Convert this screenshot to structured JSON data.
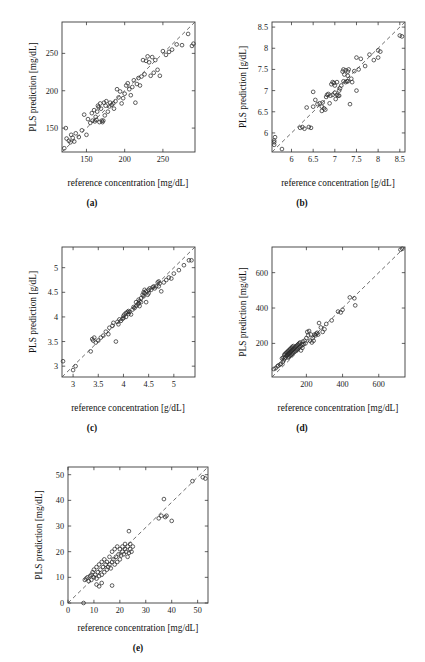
{
  "figure": {
    "type": "multi-panel-scatter-figure",
    "panel_count": 5,
    "background_color": "#ffffff",
    "marker_color": "#2b2b2b",
    "line_color": "#555555",
    "axis_color": "#3a3a3a"
  },
  "panels": [
    {
      "id": "a",
      "caption": "(a)",
      "xlabel": "reference concentration [mg/dL]",
      "ylabel": "PLS prediction [mg/dL]"
    },
    {
      "id": "b",
      "caption": "(b)",
      "xlabel": "reference concentration [g/dL]",
      "ylabel": "PLS prediction [g/dL]"
    },
    {
      "id": "c",
      "caption": "(c)",
      "xlabel": "reference concentration [g/dL]",
      "ylabel": "PLS prediction [g/dL]"
    },
    {
      "id": "d",
      "caption": "(d)",
      "xlabel": "reference concentration [mg/dL]",
      "ylabel": "PLS prediction [mg/dL]"
    },
    {
      "id": "e",
      "caption": "(e)",
      "xlabel": "reference concentration [mg/dL]",
      "ylabel": "PLS prediction [mg/dL]"
    }
  ],
  "chart_data": [
    {
      "type": "scatter",
      "panel": "a",
      "title": "(a)",
      "xlabel": "reference concentration [mg/dL]",
      "ylabel": "PLS prediction [mg/dL]",
      "xlim": [
        118,
        292
      ],
      "ylim": [
        118,
        292
      ],
      "xticks": [
        150,
        200,
        250
      ],
      "yticks": [
        150,
        200,
        250
      ],
      "xticklabels": [
        "150",
        "200",
        "250"
      ],
      "yticklabels": [
        "150",
        "200",
        "250"
      ],
      "grid": false,
      "legend": null,
      "reference_line": {
        "type": "identity",
        "style": "dashed",
        "from": [
          118,
          118
        ],
        "to": [
          292,
          292
        ]
      },
      "x": [
        121,
        123,
        124,
        127,
        129,
        130,
        132,
        134,
        136,
        140,
        144,
        147,
        150,
        152,
        155,
        157,
        158,
        160,
        161,
        162,
        163,
        164,
        165,
        166,
        167,
        168,
        169,
        170,
        171,
        172,
        173,
        174,
        175,
        176,
        178,
        180,
        181,
        183,
        185,
        186,
        188,
        190,
        192,
        194,
        196,
        198,
        200,
        202,
        204,
        206,
        208,
        210,
        212,
        214,
        216,
        218,
        220,
        222,
        224,
        226,
        228,
        230,
        232,
        234,
        236,
        238,
        240,
        243,
        246,
        250,
        254,
        258,
        262,
        268,
        275,
        283,
        288,
        290
      ],
      "y": [
        123,
        150,
        136,
        133,
        131,
        141,
        137,
        132,
        143,
        138,
        147,
        168,
        141,
        162,
        157,
        170,
        160,
        174,
        159,
        165,
        161,
        172,
        180,
        178,
        158,
        183,
        176,
        160,
        158,
        160,
        184,
        167,
        180,
        186,
        172,
        179,
        184,
        181,
        183,
        176,
        186,
        202,
        191,
        199,
        183,
        190,
        196,
        207,
        210,
        202,
        194,
        205,
        214,
        184,
        209,
        217,
        207,
        219,
        241,
        222,
        240,
        246,
        238,
        220,
        245,
        224,
        241,
        228,
        220,
        253,
        248,
        252,
        255,
        262,
        261,
        276,
        260,
        263
      ],
      "n_points": 78
    },
    {
      "type": "scatter",
      "panel": "b",
      "title": "(b)",
      "xlabel": "reference concentration [g/dL]",
      "ylabel": "PLS prediction [g/dL]",
      "xlim": [
        5.55,
        8.62
      ],
      "ylim": [
        5.55,
        8.62
      ],
      "xticks": [
        6,
        6.5,
        7,
        7.5,
        8,
        8.5
      ],
      "yticks": [
        6,
        6.5,
        7,
        7.5,
        8,
        8.5
      ],
      "xticklabels": [
        "6",
        "6.5",
        "7",
        "7.5",
        "8",
        "8.5"
      ],
      "yticklabels": [
        "6",
        "6.5",
        "7",
        "7.5",
        "8",
        "8.5"
      ],
      "grid": false,
      "legend": null,
      "reference_line": {
        "type": "identity",
        "style": "dashed",
        "from": [
          5.55,
          5.55
        ],
        "to": [
          8.62,
          8.62
        ]
      },
      "x": [
        5.6,
        5.6,
        5.6,
        5.62,
        5.78,
        6.2,
        6.25,
        6.3,
        6.35,
        6.4,
        6.45,
        6.5,
        6.5,
        6.55,
        6.6,
        6.65,
        6.7,
        6.7,
        6.72,
        6.75,
        6.78,
        6.8,
        6.82,
        6.85,
        6.88,
        6.9,
        6.92,
        6.95,
        6.95,
        6.98,
        7.0,
        7.0,
        7.02,
        7.05,
        7.05,
        7.08,
        7.1,
        7.1,
        7.12,
        7.15,
        7.18,
        7.2,
        7.2,
        7.22,
        7.25,
        7.25,
        7.28,
        7.3,
        7.3,
        7.3,
        7.32,
        7.35,
        7.38,
        7.4,
        7.45,
        7.5,
        7.5,
        7.55,
        7.6,
        7.7,
        7.8,
        7.9,
        8.0,
        8.0,
        8.05,
        8.5,
        8.55
      ],
      "y": [
        5.82,
        5.78,
        5.72,
        5.9,
        5.62,
        6.12,
        6.14,
        6.1,
        6.6,
        6.14,
        6.12,
        6.97,
        6.62,
        6.78,
        6.68,
        6.7,
        6.52,
        6.62,
        6.72,
        6.58,
        6.55,
        6.85,
        6.9,
        6.92,
        6.7,
        6.88,
        7.15,
        6.9,
        7.2,
        7.18,
        7.12,
        6.95,
        6.8,
        6.9,
        7.2,
        6.88,
        7.0,
        6.88,
        7.05,
        7.12,
        7.45,
        7.5,
        7.22,
        7.38,
        7.48,
        7.2,
        7.22,
        7.22,
        7.35,
        7.45,
        7.5,
        6.68,
        7.28,
        7.2,
        7.46,
        7.0,
        7.78,
        7.5,
        7.75,
        7.58,
        7.85,
        7.72,
        7.95,
        7.78,
        7.92,
        8.3,
        8.28
      ],
      "n_points": 67
    },
    {
      "type": "scatter",
      "panel": "c",
      "title": "(c)",
      "xlabel": "reference concentration [g/dL]",
      "ylabel": "PLS prediction [g/dL]",
      "xlim": [
        2.78,
        5.42
      ],
      "ylim": [
        2.78,
        5.42
      ],
      "xticks": [
        3,
        3.5,
        4,
        4.5,
        5
      ],
      "yticks": [
        3,
        3.5,
        4,
        4.5,
        5
      ],
      "xticklabels": [
        "3",
        "3.5",
        "4",
        "4.5",
        "5"
      ],
      "yticklabels": [
        "3",
        "3.5",
        "4",
        "4.5",
        "5"
      ],
      "grid": false,
      "legend": null,
      "reference_line": {
        "type": "identity",
        "style": "dashed",
        "from": [
          2.78,
          2.78
        ],
        "to": [
          5.42,
          5.42
        ]
      },
      "x": [
        2.8,
        3.0,
        3.05,
        3.35,
        3.38,
        3.4,
        3.42,
        3.45,
        3.5,
        3.55,
        3.6,
        3.65,
        3.7,
        3.72,
        3.78,
        3.8,
        3.85,
        3.88,
        3.9,
        3.92,
        3.95,
        3.98,
        4.0,
        4.0,
        4.02,
        4.05,
        4.05,
        4.08,
        4.1,
        4.1,
        4.12,
        4.15,
        4.18,
        4.2,
        4.22,
        4.25,
        4.25,
        4.28,
        4.3,
        4.3,
        4.32,
        4.32,
        4.35,
        4.35,
        4.38,
        4.4,
        4.4,
        4.42,
        4.42,
        4.45,
        4.45,
        4.48,
        4.5,
        4.5,
        4.52,
        4.55,
        4.58,
        4.6,
        4.62,
        4.65,
        4.68,
        4.7,
        4.7,
        4.72,
        4.75,
        4.8,
        4.85,
        4.9,
        4.95,
        5.0,
        5.1,
        5.2,
        5.3,
        5.35
      ],
      "y": [
        3.1,
        2.92,
        3.0,
        3.3,
        3.55,
        3.52,
        3.58,
        3.48,
        3.52,
        3.58,
        3.62,
        3.7,
        3.65,
        3.78,
        3.82,
        3.88,
        3.5,
        3.9,
        3.85,
        3.95,
        3.92,
        3.96,
        4.02,
        3.98,
        4.05,
        4.08,
        4.0,
        4.1,
        4.06,
        4.12,
        4.1,
        4.05,
        4.15,
        4.2,
        4.18,
        4.22,
        4.3,
        4.25,
        4.28,
        4.35,
        4.32,
        4.22,
        4.38,
        4.3,
        4.45,
        4.5,
        4.42,
        4.48,
        4.55,
        4.52,
        4.3,
        4.45,
        4.55,
        4.48,
        4.58,
        4.55,
        4.6,
        4.62,
        4.58,
        4.62,
        4.7,
        4.72,
        4.62,
        4.68,
        4.52,
        4.7,
        4.75,
        4.8,
        4.78,
        4.88,
        4.95,
        5.05,
        5.15,
        5.15
      ],
      "n_points": 74
    },
    {
      "type": "scatter",
      "panel": "d",
      "title": "(d)",
      "xlabel": "reference concentration [mg/dL]",
      "ylabel": "PLS prediction [mg/dL]",
      "xlim": [
        10,
        745
      ],
      "ylim": [
        10,
        745
      ],
      "xticks": [
        200,
        400,
        600
      ],
      "yticks": [
        200,
        400,
        600
      ],
      "xticklabels": [
        "200",
        "400",
        "600"
      ],
      "yticklabels": [
        "200",
        "400",
        "600"
      ],
      "grid": false,
      "legend": null,
      "reference_line": {
        "type": "identity",
        "style": "dashed",
        "from": [
          10,
          10
        ],
        "to": [
          745,
          745
        ]
      },
      "x": [
        20,
        30,
        40,
        45,
        55,
        60,
        65,
        70,
        72,
        75,
        78,
        80,
        82,
        85,
        88,
        90,
        92,
        95,
        98,
        100,
        100,
        102,
        105,
        105,
        108,
        110,
        110,
        112,
        115,
        115,
        118,
        120,
        120,
        122,
        125,
        125,
        128,
        130,
        132,
        135,
        138,
        140,
        142,
        145,
        148,
        150,
        152,
        155,
        158,
        160,
        162,
        165,
        168,
        170,
        175,
        178,
        180,
        185,
        190,
        195,
        200,
        205,
        210,
        215,
        220,
        225,
        230,
        235,
        240,
        245,
        250,
        255,
        260,
        265,
        270,
        280,
        290,
        300,
        310,
        340,
        375,
        390,
        400,
        440,
        465,
        470,
        720,
        730
      ],
      "y": [
        55,
        60,
        70,
        75,
        80,
        85,
        115,
        95,
        120,
        105,
        135,
        115,
        140,
        120,
        145,
        130,
        150,
        135,
        155,
        140,
        120,
        160,
        145,
        125,
        165,
        150,
        130,
        170,
        155,
        135,
        175,
        160,
        140,
        180,
        165,
        145,
        185,
        170,
        150,
        175,
        155,
        180,
        160,
        185,
        165,
        190,
        170,
        195,
        175,
        200,
        180,
        205,
        185,
        160,
        195,
        175,
        210,
        195,
        215,
        200,
        230,
        265,
        245,
        270,
        215,
        250,
        205,
        230,
        215,
        250,
        245,
        255,
        260,
        250,
        315,
        290,
        265,
        280,
        310,
        330,
        380,
        375,
        390,
        460,
        455,
        415,
        730,
        735
      ],
      "n_points": 88
    },
    {
      "type": "scatter",
      "panel": "e",
      "title": "(e)",
      "xlabel": "reference concentration [mg/dL]",
      "ylabel": "PLS prediction [mg/dL]",
      "xlim": [
        0,
        54
      ],
      "ylim": [
        0,
        53
      ],
      "xticks": [
        0,
        10,
        20,
        30,
        40,
        50
      ],
      "yticks": [
        0,
        10,
        20,
        30,
        40,
        50
      ],
      "xticklabels": [
        "0",
        "10",
        "20",
        "30",
        "40",
        "50"
      ],
      "yticklabels": [
        "0",
        "10",
        "20",
        "30",
        "40",
        "50"
      ],
      "grid": false,
      "legend": null,
      "reference_line": {
        "type": "identity",
        "style": "dashed",
        "from": [
          0,
          0
        ],
        "to": [
          54,
          53
        ]
      },
      "x": [
        6,
        6.5,
        7,
        7.5,
        8,
        8.5,
        9,
        9,
        9.5,
        10,
        10,
        10.5,
        11,
        11,
        11.5,
        12,
        12,
        12.5,
        13,
        13,
        13.5,
        14,
        14,
        14.5,
        15,
        15,
        15.5,
        16,
        16,
        16.5,
        17,
        17,
        17.5,
        18,
        18,
        18.5,
        19,
        19,
        19.5,
        20,
        20,
        20.5,
        21,
        21,
        21.5,
        22,
        22,
        22.5,
        23,
        23,
        23.5,
        24,
        24,
        24.5,
        25,
        17,
        12,
        13,
        11,
        23.5,
        35,
        36,
        37,
        37.5,
        38,
        40,
        48,
        52,
        53
      ],
      "y": [
        0,
        9,
        9.5,
        10,
        8.5,
        10.5,
        9,
        11,
        12,
        10,
        13,
        11,
        9.5,
        14,
        12,
        10.5,
        15,
        13,
        11,
        16,
        14,
        12,
        17,
        15,
        13,
        16,
        14,
        18,
        15,
        13.5,
        16,
        20,
        17,
        15,
        21,
        18,
        16,
        22,
        19,
        17,
        21,
        18.5,
        20,
        22,
        19,
        21,
        23,
        20,
        18,
        22,
        19.5,
        21,
        23,
        20,
        22,
        6.8,
        6.5,
        7.8,
        7.2,
        28,
        33,
        34,
        40.5,
        33.5,
        34,
        32,
        47.5,
        49,
        48.5
      ],
      "n_points": 69
    }
  ]
}
